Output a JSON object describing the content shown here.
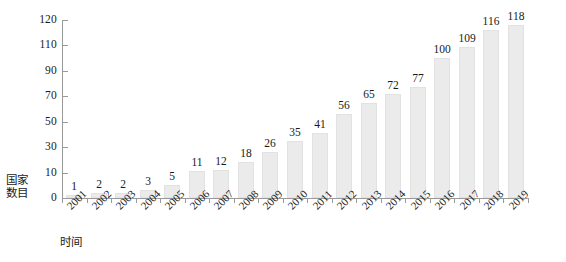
{
  "chart_data": {
    "type": "bar",
    "title": "",
    "xlabel": "时间",
    "ylabel": "国家数目",
    "ylabel_lines": [
      "国家",
      "数目"
    ],
    "categories": [
      "2001",
      "2002",
      "2003",
      "2004",
      "2005",
      "2006",
      "2007",
      "2008",
      "2009",
      "2010",
      "2011",
      "2012",
      "2013",
      "2014",
      "2015",
      "2016",
      "2017",
      "2018",
      "2019"
    ],
    "values": [
      1,
      2,
      2,
      3,
      5,
      11,
      12,
      18,
      26,
      35,
      41,
      56,
      65,
      72,
      77,
      100,
      109,
      116,
      118
    ],
    "value_labels": [
      "1",
      "2",
      "2",
      "3",
      "5",
      "11",
      "12",
      "18",
      "26",
      "35",
      "41",
      "56",
      "65",
      "72",
      "77",
      "100",
      "109",
      "116",
      "118"
    ],
    "y_ticks": [
      0,
      10,
      30,
      50,
      70,
      90,
      110,
      120
    ],
    "y_tick_labels": [
      "0",
      "10",
      "30",
      "50",
      "70",
      "90",
      "110",
      "120"
    ],
    "ylim": [
      0,
      120
    ],
    "grid": false,
    "legend": false,
    "bar_color": "#ebebeb",
    "bar_edge_color": "#e2e2e2",
    "axis_color": "#9a9a9a",
    "text_color": "#1a1a1a"
  }
}
